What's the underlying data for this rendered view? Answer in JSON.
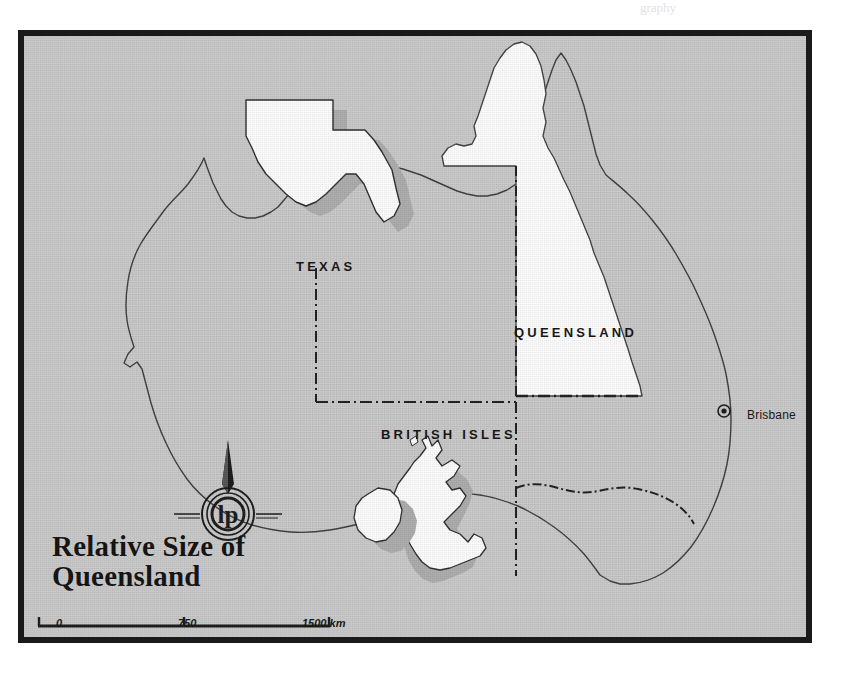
{
  "figure": {
    "title_line1": "Relative Size of",
    "title_line2": "Queensland",
    "frame_color": "#1a1a1a",
    "background_color": "#c8c8c8",
    "land_fill_color": "#c8c8c8",
    "overlay_fill_color": "#fbfbfb",
    "shadow_color": "#a8a8a8",
    "outline_color": "#3a3a3a"
  },
  "regions": [
    {
      "name": "TEXAS",
      "label": "TEXAS"
    },
    {
      "name": "QUEENSLAND",
      "label": "QUEENSLAND"
    },
    {
      "name": "BRITISH ISLES",
      "label": "BRITISH ISLES"
    }
  ],
  "labels": {
    "texas": "TEXAS",
    "queensland": "QUEENSLAND",
    "british_isles": "BRITISH ISLES"
  },
  "cities": [
    {
      "name": "Brisbane",
      "label": "Brisbane",
      "marker": "circled-dot"
    }
  ],
  "scale_bar": {
    "unit": "km",
    "ticks": [
      "0",
      "750",
      "1500 km"
    ],
    "tick_values": [
      0,
      750,
      1500
    ]
  },
  "compass": {
    "type": "north-arrow",
    "logo_text": "lp"
  },
  "page_bleed": [
    {
      "text": "graphy",
      "left": 640,
      "top": 2
    }
  ]
}
